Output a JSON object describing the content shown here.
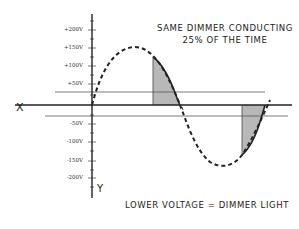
{
  "diagram": {
    "title": {
      "line1": "SAME DIMMER CONDUCTING",
      "line2": "25% OF THE TIME"
    },
    "caption": "LOWER VOLTAGE = DIMMER LIGHT",
    "axes": {
      "x_label": "X",
      "y_label": "Y"
    },
    "y_ticks": [
      {
        "label": "+200V",
        "value": 200
      },
      {
        "label": "+150V",
        "value": 150
      },
      {
        "label": "+100V",
        "value": 100
      },
      {
        "label": "+50V",
        "value": 50
      },
      {
        "label": "-50V",
        "value": -50
      },
      {
        "label": "-100V",
        "value": -100
      },
      {
        "label": "-150V",
        "value": -150
      },
      {
        "label": "-200V",
        "value": -200
      }
    ],
    "waveform": {
      "type": "sine",
      "style": "dashed",
      "peak_voltage": "~+150V",
      "trough_voltage": "~-150V"
    },
    "shaded_regions": [
      {
        "name": "positive-conduction",
        "description": "last quarter of positive half-cycle"
      },
      {
        "name": "negative-conduction",
        "description": "last quarter of negative half-cycle"
      }
    ],
    "threshold_lines": [
      {
        "value": 30
      },
      {
        "value": -30
      }
    ],
    "colors": {
      "ink": "#222222",
      "shade": "#b8b8b8",
      "threshold_line": "#555555"
    }
  }
}
